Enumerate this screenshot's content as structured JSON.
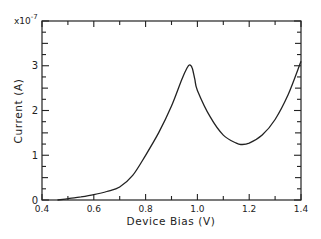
{
  "chart_data": {
    "type": "line",
    "title": "",
    "xlabel": "Device Bias (V)",
    "ylabel": "Current (A)",
    "y_multiplier": "x10",
    "y_multiplier_exp": "-7",
    "xlim": [
      0.4,
      1.4
    ],
    "ylim": [
      0,
      4
    ],
    "x_ticks": [
      0.4,
      0.6,
      0.8,
      1.0,
      1.2,
      1.4
    ],
    "x_tick_labels": [
      "0.4",
      "0.6",
      "0.8",
      "1.0",
      "1.2",
      "1.4"
    ],
    "y_ticks": [
      0,
      1,
      2,
      3
    ],
    "y_tick_labels": [
      "0",
      "1",
      "2",
      "3"
    ],
    "grid": false,
    "legend": null,
    "series": [
      {
        "name": "I-V",
        "x": [
          0.46,
          0.5,
          0.55,
          0.6,
          0.65,
          0.7,
          0.75,
          0.8,
          0.85,
          0.9,
          0.94,
          0.96,
          0.97,
          0.98,
          0.99,
          1.0,
          1.05,
          1.1,
          1.15,
          1.17,
          1.2,
          1.25,
          1.3,
          1.35,
          1.4
        ],
        "y": [
          0.0,
          0.03,
          0.07,
          0.12,
          0.19,
          0.29,
          0.55,
          1.0,
          1.5,
          2.1,
          2.7,
          2.95,
          3.02,
          2.95,
          2.7,
          2.45,
          1.85,
          1.45,
          1.27,
          1.24,
          1.27,
          1.45,
          1.8,
          2.35,
          3.1
        ]
      }
    ],
    "color": "#222222"
  }
}
